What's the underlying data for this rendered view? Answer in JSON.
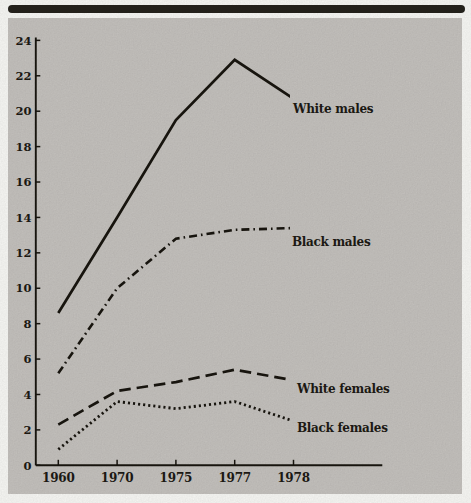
{
  "page": {
    "background_color": "#fbfbf8",
    "panel_color": "#c7c4c0",
    "rule_color": "#26231d",
    "text_color": "#1b1813"
  },
  "chart_data": {
    "type": "line",
    "title": "",
    "xlabel": "",
    "ylabel": "",
    "categories": [
      "1960",
      "1970",
      "1975",
      "1977",
      "1978"
    ],
    "y_ticks": [
      0,
      2,
      4,
      6,
      8,
      10,
      12,
      14,
      16,
      18,
      20,
      22,
      24
    ],
    "ylim": [
      0,
      24
    ],
    "grid": false,
    "legend_position": "inline-labels-at-line-ends",
    "line_color": "#17140e",
    "series": [
      {
        "name": "White males",
        "style": "solid",
        "values": [
          8.6,
          14.0,
          19.5,
          22.9,
          20.7
        ]
      },
      {
        "name": "Black males",
        "style": "dash-dot",
        "values": [
          5.2,
          10.0,
          12.8,
          13.3,
          13.4
        ]
      },
      {
        "name": "White females",
        "style": "dashed",
        "values": [
          2.3,
          4.2,
          4.7,
          5.4,
          4.8
        ]
      },
      {
        "name": "Black females",
        "style": "dotted",
        "values": [
          0.9,
          3.6,
          3.2,
          3.6,
          2.5
        ]
      }
    ]
  }
}
